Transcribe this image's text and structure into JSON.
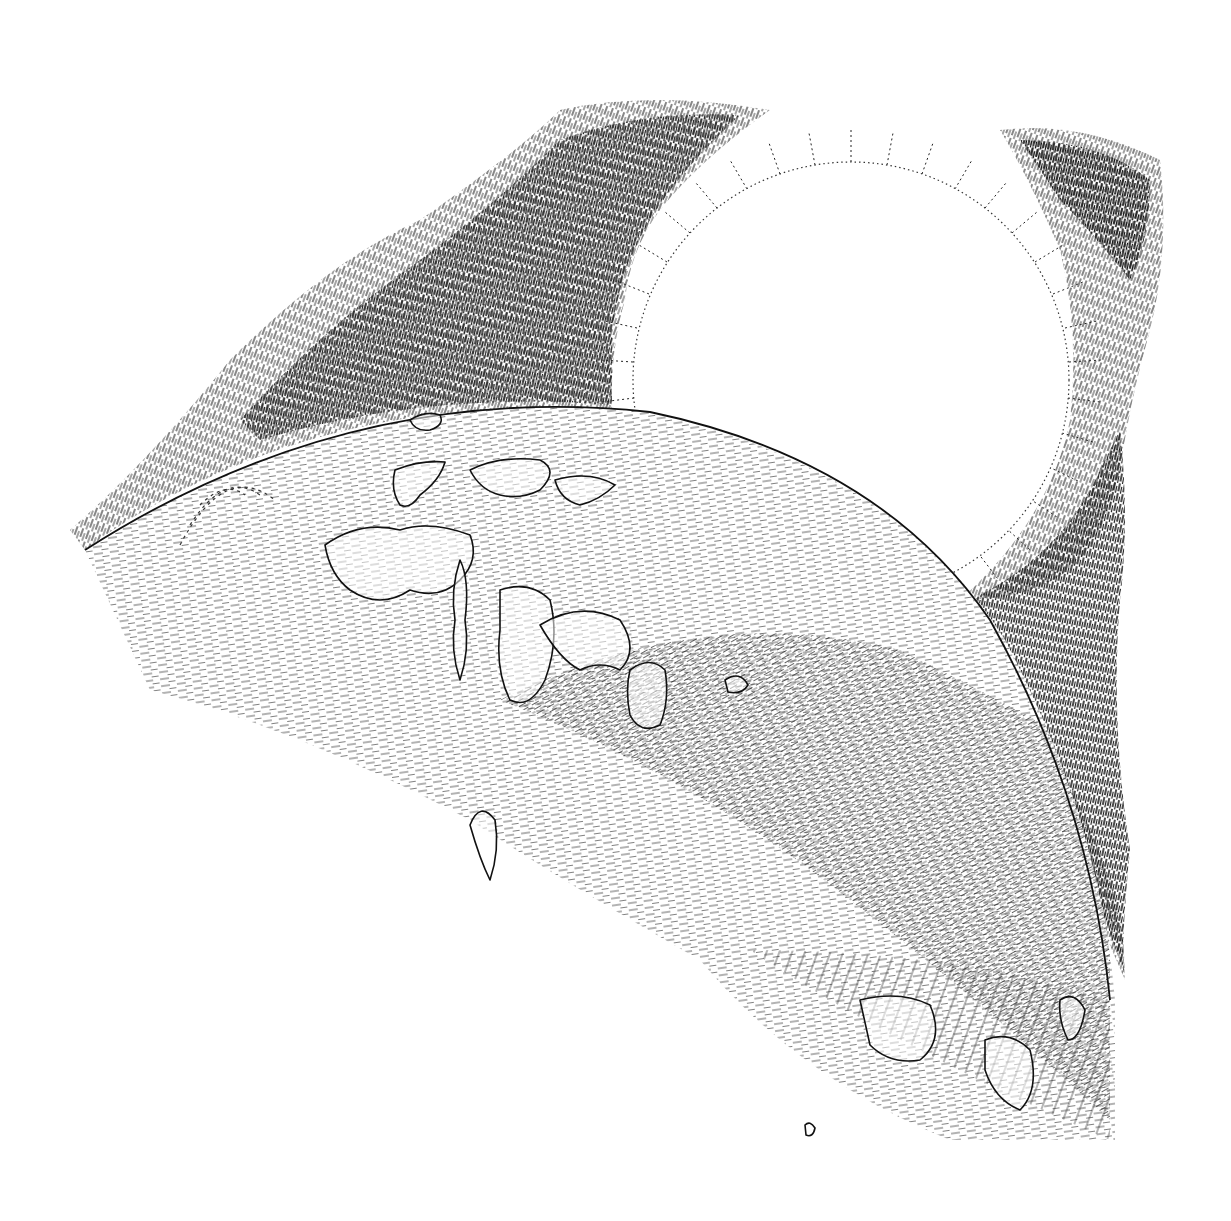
{
  "illustration": {
    "title": "",
    "style": "pen-and-ink hatching",
    "subject": "planet horizon with eclipsed sun and corona",
    "colors": {
      "background": "#ffffff",
      "ink": "#111111",
      "hatch_light": "#555555"
    },
    "elements": [
      {
        "name": "sun-disk",
        "cx": 851,
        "cy": 380,
        "r": 218
      },
      {
        "name": "sun-rays-ring",
        "inner_r": 218,
        "outer_r": 250
      },
      {
        "name": "corona-left",
        "description": "dense dark hatched band rising from left horizon to top center"
      },
      {
        "name": "corona-right",
        "description": "dark hatched band on right edge of sun down to planet limb"
      },
      {
        "name": "planet-limb",
        "cx": 560,
        "cy": 1560,
        "r": 1150
      },
      {
        "name": "continents",
        "description": "outlined land masses with dashed hatching"
      }
    ]
  }
}
